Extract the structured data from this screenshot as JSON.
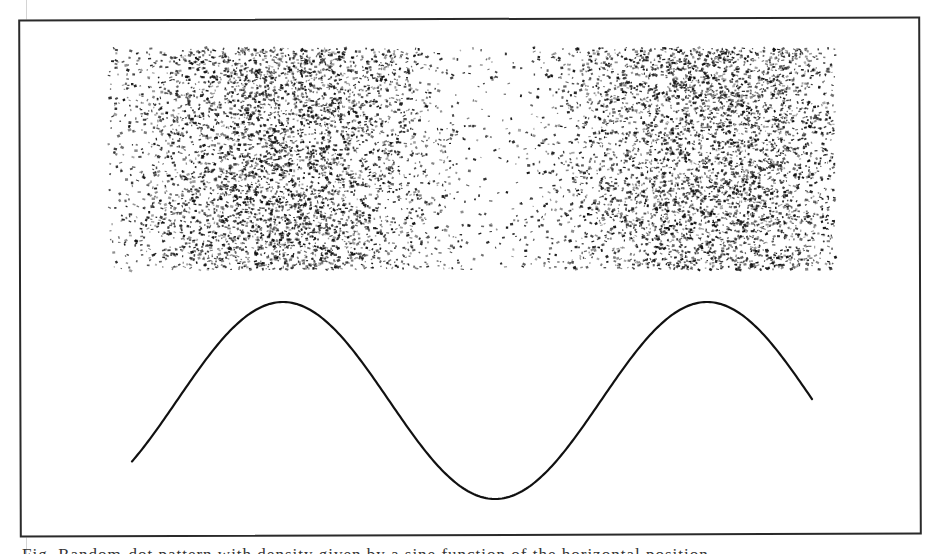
{
  "figure": {
    "frame": {
      "x": 19,
      "y": 18,
      "width": 902,
      "height": 518,
      "stroke": "#2a2a2a"
    },
    "noise_panel": {
      "x0": 107,
      "y0": 47,
      "x1": 834,
      "y1": 269,
      "dot_color": "#111111",
      "dot_count": 9000,
      "density_follows": "sine_curve",
      "min_density": 0.07,
      "seed": 1337
    },
    "sine_curve": {
      "x_start": 132,
      "x_end": 813,
      "midline_y": 400.5,
      "amplitude_px": 98.5,
      "period_px": 424,
      "first_peak_x": 283,
      "peaks": [
        {
          "x": 283,
          "y": 302
        },
        {
          "x": 707,
          "y": 302
        }
      ],
      "troughs": [
        {
          "x": 496,
          "y": 499
        }
      ],
      "stroke": "#111111",
      "stroke_width": 2.2
    }
  },
  "caption": {
    "text": "Fig.  Random-dot pattern with density given by a sine function of the horizontal position"
  }
}
